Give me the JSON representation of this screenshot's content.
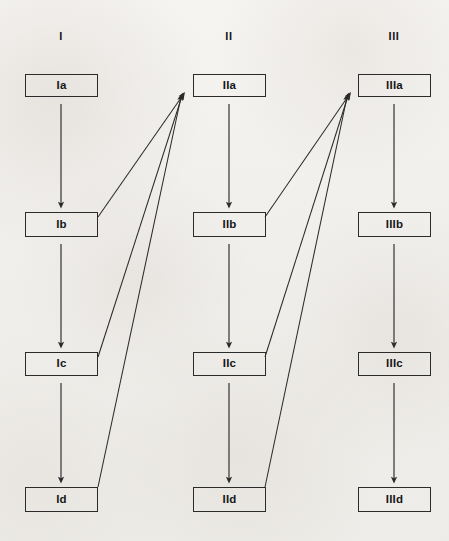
{
  "diagram": {
    "canvas": {
      "width": 449,
      "height": 541
    },
    "style": {
      "background_color": "#f3f1ee",
      "line_color": "#2b2b2b",
      "text_color": "#171717",
      "box_fill": "none"
    },
    "headers": [
      {
        "label": "I",
        "x": 61,
        "y": 30
      },
      {
        "label": "II",
        "x": 229,
        "y": 30
      },
      {
        "label": "III",
        "x": 394,
        "y": 30
      }
    ],
    "nodes": [
      {
        "id": "Ia",
        "label": "Ia",
        "x": 25,
        "y": 74,
        "w": 73,
        "h": 23
      },
      {
        "id": "Ib",
        "label": "Ib",
        "x": 25,
        "y": 212,
        "w": 73,
        "h": 25
      },
      {
        "id": "Ic",
        "label": "Ic",
        "x": 25,
        "y": 352,
        "w": 73,
        "h": 24
      },
      {
        "id": "Id",
        "label": "Id",
        "x": 25,
        "y": 487,
        "w": 73,
        "h": 25
      },
      {
        "id": "IIa",
        "label": "IIa",
        "x": 193,
        "y": 74,
        "w": 73,
        "h": 23
      },
      {
        "id": "IIb",
        "label": "IIb",
        "x": 193,
        "y": 212,
        "w": 73,
        "h": 25
      },
      {
        "id": "IIc",
        "label": "IIc",
        "x": 193,
        "y": 352,
        "w": 73,
        "h": 24
      },
      {
        "id": "IId",
        "label": "IId",
        "x": 193,
        "y": 487,
        "w": 73,
        "h": 25
      },
      {
        "id": "IIIa",
        "label": "IIIa",
        "x": 358,
        "y": 74,
        "w": 73,
        "h": 23
      },
      {
        "id": "IIIb",
        "label": "IIIb",
        "x": 358,
        "y": 212,
        "w": 73,
        "h": 25
      },
      {
        "id": "IIIc",
        "label": "IIIc",
        "x": 358,
        "y": 352,
        "w": 73,
        "h": 24
      },
      {
        "id": "IIId",
        "label": "IIId",
        "x": 358,
        "y": 487,
        "w": 73,
        "h": 25
      }
    ],
    "edges": [
      {
        "from": "Ia",
        "to": "Ib",
        "kind": "vertical",
        "x1": 61,
        "y1": 104,
        "x2": 61,
        "y2": 205
      },
      {
        "from": "Ib",
        "to": "Ic",
        "kind": "vertical",
        "x1": 61,
        "y1": 244,
        "x2": 61,
        "y2": 345
      },
      {
        "from": "Ic",
        "to": "Id",
        "kind": "vertical",
        "x1": 61,
        "y1": 383,
        "x2": 61,
        "y2": 480
      },
      {
        "from": "IIa",
        "to": "IIb",
        "kind": "vertical",
        "x1": 229,
        "y1": 104,
        "x2": 229,
        "y2": 205
      },
      {
        "from": "IIb",
        "to": "IIc",
        "kind": "vertical",
        "x1": 229,
        "y1": 244,
        "x2": 229,
        "y2": 345
      },
      {
        "from": "IIc",
        "to": "IId",
        "kind": "vertical",
        "x1": 229,
        "y1": 383,
        "x2": 229,
        "y2": 480
      },
      {
        "from": "IIIa",
        "to": "IIIb",
        "kind": "vertical",
        "x1": 394,
        "y1": 104,
        "x2": 394,
        "y2": 205
      },
      {
        "from": "IIIb",
        "to": "IIIc",
        "kind": "vertical",
        "x1": 394,
        "y1": 244,
        "x2": 394,
        "y2": 345
      },
      {
        "from": "IIIc",
        "to": "IIId",
        "kind": "vertical",
        "x1": 394,
        "y1": 383,
        "x2": 394,
        "y2": 480
      },
      {
        "from": "Ib",
        "to": "IIa",
        "kind": "diagonal",
        "x1": 98,
        "y1": 217,
        "x2": 183,
        "y2": 95
      },
      {
        "from": "Ic",
        "to": "IIa",
        "kind": "diagonal",
        "x1": 98,
        "y1": 357,
        "x2": 182,
        "y2": 96
      },
      {
        "from": "Id",
        "to": "IIa",
        "kind": "diagonal",
        "x1": 98,
        "y1": 487,
        "x2": 181,
        "y2": 97
      },
      {
        "from": "IIb",
        "to": "IIIa",
        "kind": "diagonal",
        "x1": 265,
        "y1": 217,
        "x2": 349,
        "y2": 95
      },
      {
        "from": "IIc",
        "to": "IIIa",
        "kind": "diagonal",
        "x1": 265,
        "y1": 357,
        "x2": 348,
        "y2": 96
      },
      {
        "from": "IId",
        "to": "IIIa",
        "kind": "diagonal",
        "x1": 265,
        "y1": 487,
        "x2": 347,
        "y2": 97
      }
    ]
  }
}
